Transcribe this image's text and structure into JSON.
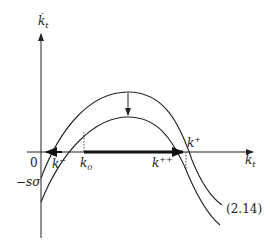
{
  "diagram": {
    "y_axis_label": "k",
    "y_axis_label_sub": "t",
    "x_axis_label": "k",
    "x_axis_label_sub": "t",
    "origin_label": "0",
    "intercept_label": "−sσ",
    "k_minus_label": "k",
    "k_minus_sup": "−",
    "k0_label": "k",
    "k0_sub": "0",
    "k_plus_label": "k",
    "k_plus_sup": "+",
    "k_plusplus_label": "k",
    "k_plusplus_sup": "++",
    "equation_ref": "(2.14)",
    "colors": {
      "line": "#222222",
      "background": "#ffffff"
    }
  }
}
